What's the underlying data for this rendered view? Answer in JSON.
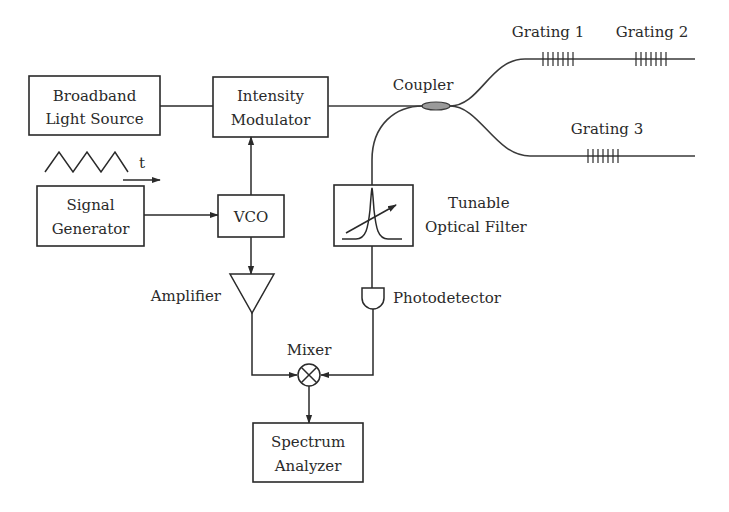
{
  "diagram": {
    "blocks": {
      "broadband": {
        "line1": "Broadband",
        "line2": "Light Source"
      },
      "modulator": {
        "line1": "Intensity",
        "line2": "Modulator"
      },
      "signal_generator": {
        "line1": "Signal",
        "line2": "Generator"
      },
      "vco": {
        "label": "VCO"
      },
      "spectrum_analyzer": {
        "line1": "Spectrum",
        "line2": "Analyzer"
      }
    },
    "labels": {
      "coupler": "Coupler",
      "grating1": "Grating 1",
      "grating2": "Grating 2",
      "grating3": "Grating 3",
      "filter_line1": "Tunable",
      "filter_line2": "Optical Filter",
      "amplifier": "Amplifier",
      "photodetector": "Photodetector",
      "mixer": "Mixer",
      "time_axis": "t"
    },
    "connections": [
      [
        "Broadband Light Source",
        "Intensity Modulator"
      ],
      [
        "Intensity Modulator",
        "Coupler"
      ],
      [
        "Coupler",
        "Grating 1"
      ],
      [
        "Grating 1",
        "Grating 2"
      ],
      [
        "Coupler",
        "Grating 3"
      ],
      [
        "Coupler",
        "Tunable Optical Filter"
      ],
      [
        "Tunable Optical Filter",
        "Photodetector"
      ],
      [
        "Photodetector",
        "Mixer"
      ],
      [
        "Signal Generator",
        "VCO"
      ],
      [
        "VCO",
        "Intensity Modulator"
      ],
      [
        "VCO",
        "Amplifier"
      ],
      [
        "Amplifier",
        "Mixer"
      ],
      [
        "Mixer",
        "Spectrum Analyzer"
      ]
    ],
    "colors": {
      "line": "#2a2a2a",
      "coupler_fill": "#9a9a9a",
      "background": "#ffffff"
    }
  }
}
